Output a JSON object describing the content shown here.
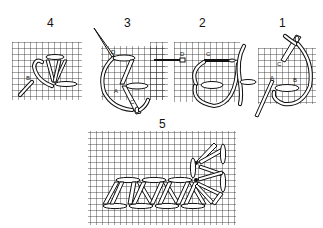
{
  "diagram": {
    "type": "embroidery-stitch-steps",
    "colors": {
      "ink": "#111111",
      "background": "#ffffff"
    },
    "steps": [
      {
        "number": "4",
        "labels": [
          "B"
        ]
      },
      {
        "number": "3",
        "labels": [
          "D",
          "A",
          "C"
        ]
      },
      {
        "number": "2",
        "labels": [
          "D",
          "C"
        ]
      },
      {
        "number": "1",
        "labels": [
          "C",
          "A",
          "B"
        ]
      },
      {
        "number": "5",
        "labels": []
      }
    ]
  }
}
